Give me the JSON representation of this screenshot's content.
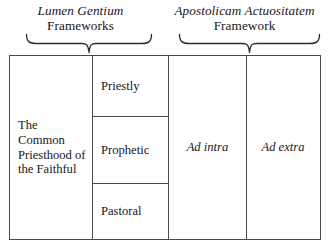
{
  "figure": {
    "name": "common-priesthood-munera-matrix",
    "colors": {
      "background": "#ffffff",
      "text": "#17161a",
      "border": "#4a4a4e"
    }
  },
  "headings": [
    {
      "id": "lumen-gentium",
      "document": "Lumen Gentium",
      "label": "Frameworks"
    },
    {
      "id": "apostolicam-actuositatem",
      "document": "Apostolicam Actuositatem",
      "label": "Framework"
    }
  ],
  "braces": [
    {
      "id": "brace-left",
      "spans": "lumen-gentium"
    },
    {
      "id": "brace-right",
      "spans": "apostolicam-actuositatem"
    }
  ],
  "matrix": {
    "subject": {
      "label": "The Common Priesthood of the Faithful"
    },
    "munera": [
      {
        "id": "priestly",
        "label": "Priestly"
      },
      {
        "id": "prophetic",
        "label": "Prophetic"
      },
      {
        "id": "pastoral",
        "label": "Pastoral"
      }
    ],
    "orientations": [
      {
        "id": "ad-intra",
        "label": "Ad intra"
      },
      {
        "id": "ad-extra",
        "label": "Ad extra"
      }
    ]
  }
}
